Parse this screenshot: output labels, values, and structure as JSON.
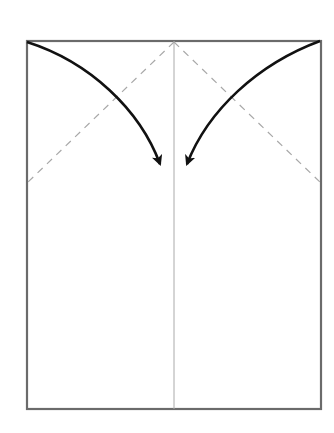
{
  "diagram": {
    "title": "Origami fold step: fold top corners to center line",
    "colors": {
      "background": "#ffffff",
      "paper_border": "#6b6b6b",
      "center_crease": "#aaaaaa",
      "dashed_fold": "#a8a8a8",
      "arrow": "#111111"
    },
    "paper": {
      "x1": 27,
      "y1": 41,
      "x2": 321,
      "y2": 409
    },
    "center_line": {
      "x": 174,
      "y1": 41,
      "y2": 409
    },
    "fold_lines": [
      {
        "name": "left-valley-fold",
        "from": [
          174,
          41
        ],
        "to": [
          27,
          182
        ],
        "style": "dashed"
      },
      {
        "name": "right-valley-fold",
        "from": [
          174,
          41
        ],
        "to": [
          321,
          182
        ],
        "style": "dashed"
      }
    ],
    "arrows": [
      {
        "name": "left-corner-arrow",
        "from": [
          27,
          42
        ],
        "to": [
          162,
          170
        ],
        "direction": "top-left corner to center"
      },
      {
        "name": "right-corner-arrow",
        "from": [
          320,
          41
        ],
        "to": [
          184,
          170
        ],
        "direction": "top-right corner to center"
      }
    ]
  }
}
